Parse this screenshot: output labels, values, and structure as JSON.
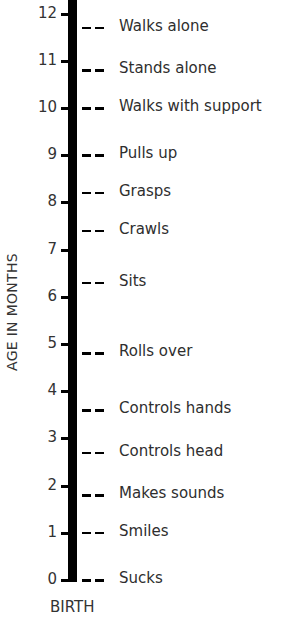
{
  "chart_data": {
    "type": "timeline",
    "title": "",
    "ylabel": "AGE IN MONTHS",
    "xlabel": "BIRTH",
    "ylim": [
      0,
      12
    ],
    "yticks": [
      0,
      1,
      2,
      3,
      4,
      5,
      6,
      7,
      8,
      9,
      10,
      11,
      12
    ],
    "milestones": [
      {
        "label": "Sucks",
        "month": 0.0
      },
      {
        "label": "Smiles",
        "month": 1.0
      },
      {
        "label": "Makes sounds",
        "month": 1.8
      },
      {
        "label": "Controls head",
        "month": 2.7
      },
      {
        "label": "Controls hands",
        "month": 3.6
      },
      {
        "label": "Rolls over",
        "month": 4.8
      },
      {
        "label": "Sits",
        "month": 6.3
      },
      {
        "label": "Crawls",
        "month": 7.4
      },
      {
        "label": "Grasps",
        "month": 8.2
      },
      {
        "label": "Pulls up",
        "month": 9.0
      },
      {
        "label": "Walks with support",
        "month": 10.0
      },
      {
        "label": "Stands alone",
        "month": 10.8
      },
      {
        "label": "Walks alone",
        "month": 11.7
      }
    ],
    "colors": {
      "axis": "#000000",
      "text": "#2e2e2e",
      "background": "#ffffff"
    }
  }
}
